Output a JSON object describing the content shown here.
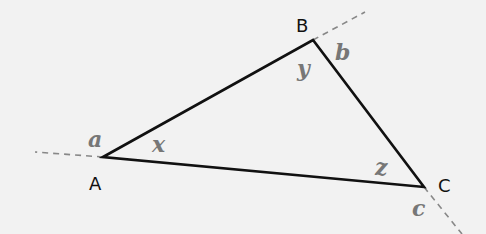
{
  "diagram": {
    "type": "triangle-angles",
    "colors": {
      "background": "#f2f2f2",
      "edges": "#111111",
      "extensions": "#888888",
      "vertex_labels": "#111111",
      "angle_labels": "#777777"
    },
    "vertices": {
      "A": {
        "label": "A",
        "x": 103,
        "y": 157
      },
      "B": {
        "label": "B",
        "x": 313,
        "y": 40
      },
      "C": {
        "label": "C",
        "x": 424,
        "y": 187
      }
    },
    "interior_angles": {
      "x": {
        "label": "x",
        "at": "A"
      },
      "y": {
        "label": "y",
        "at": "B"
      },
      "z": {
        "label": "z",
        "at": "C"
      }
    },
    "exterior_angles": {
      "a": {
        "label": "a",
        "at": "A"
      },
      "b": {
        "label": "b",
        "at": "B"
      },
      "c": {
        "label": "c",
        "at": "C"
      }
    },
    "extensions": [
      {
        "from": "A",
        "direction": "extends CA beyond A"
      },
      {
        "from": "B",
        "direction": "extends AB beyond B"
      },
      {
        "from": "C",
        "direction": "extends BC beyond C"
      }
    ]
  }
}
